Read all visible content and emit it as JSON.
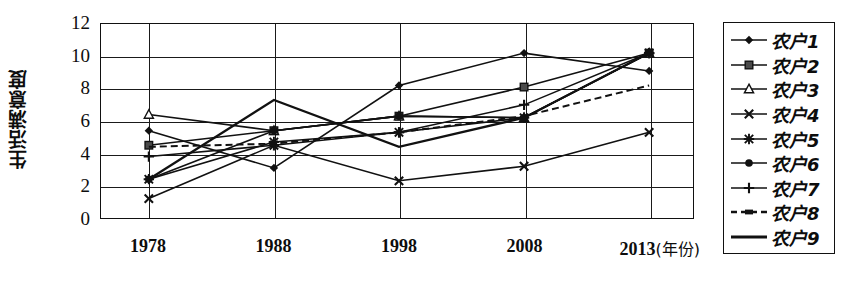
{
  "chart_data": {
    "type": "line",
    "title": "",
    "xlabel": "年份",
    "ylabel": "生活满意度",
    "categories": [
      "1978",
      "1988",
      "1998",
      "2008",
      "2013"
    ],
    "ylim": [
      0,
      12
    ],
    "yticks": [
      0,
      2,
      4,
      6,
      8,
      10,
      12
    ],
    "grid": true,
    "legend_position": "right",
    "series": [
      {
        "name": "农户1",
        "marker": "diamond",
        "values": [
          5.4,
          3.1,
          8.2,
          10.2,
          9.1
        ]
      },
      {
        "name": "农户2",
        "marker": "square",
        "values": [
          4.5,
          5.4,
          6.3,
          8.1,
          10.2
        ]
      },
      {
        "name": "农户3",
        "marker": "triangle",
        "values": [
          6.4,
          5.4,
          6.3,
          6.2,
          10.2
        ]
      },
      {
        "name": "农户4",
        "marker": "cross",
        "values": [
          1.2,
          4.5,
          2.3,
          3.2,
          5.3
        ]
      },
      {
        "name": "农户5",
        "marker": "asterisk",
        "values": [
          2.4,
          4.7,
          5.3,
          6.2,
          10.2
        ]
      },
      {
        "name": "农户6",
        "marker": "circle",
        "values": [
          2.4,
          5.4,
          6.3,
          6.2,
          10.2
        ]
      },
      {
        "name": "农户7",
        "marker": "plus",
        "values": [
          3.8,
          4.5,
          5.3,
          7.0,
          10.2
        ]
      },
      {
        "name": "农户8",
        "marker": "dashed",
        "values": [
          4.4,
          4.6,
          5.3,
          6.3,
          8.2
        ]
      },
      {
        "name": "农户9",
        "marker": "line",
        "values": [
          2.4,
          7.3,
          4.4,
          6.2,
          10.2
        ]
      }
    ]
  },
  "axis": {
    "y_title": "生活满意度",
    "y_tick_labels": [
      "12",
      "10",
      "8",
      "6",
      "4",
      "2",
      "0"
    ],
    "x_tick_labels": [
      "1978",
      "1988",
      "1998",
      "2008",
      "2013"
    ],
    "x_unit_label": "(年份)"
  },
  "legend": {
    "items": [
      {
        "label": "农户1"
      },
      {
        "label": "农户2"
      },
      {
        "label": "农户3"
      },
      {
        "label": "农户4"
      },
      {
        "label": "农户5"
      },
      {
        "label": "农户6"
      },
      {
        "label": "农户7"
      },
      {
        "label": "农户8"
      },
      {
        "label": "农户9"
      }
    ]
  }
}
